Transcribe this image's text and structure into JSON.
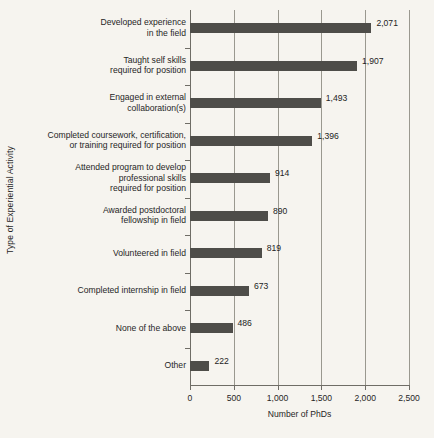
{
  "chart_data": {
    "type": "bar",
    "orientation": "horizontal",
    "title": "",
    "xlabel": "Number of PhDs",
    "ylabel": "Type of Experiential Activity",
    "xlim": [
      0,
      2500
    ],
    "xticks": [
      "0",
      "500",
      "1,000",
      "1,500",
      "2,000",
      "2,500"
    ],
    "xtick_values": [
      0,
      500,
      1000,
      1500,
      2000,
      2500
    ],
    "grid": "vertical",
    "legend": "none",
    "bar_color": "#4e4d49",
    "background_color": "#f6f4ef",
    "categories": [
      "Developed experience\nin the field",
      "Taught self skills\nrequired for position",
      "Engaged in external\ncollaboration(s)",
      "Completed coursework, certification,\nor training required for position",
      "Attended program to develop\nprofessional skills\nrequired for position",
      "Awarded postdoctoral\nfellowship in field",
      "Volunteered in field",
      "Completed internship in field",
      "None of the above",
      "Other"
    ],
    "values": [
      2071,
      1907,
      1493,
      1396,
      914,
      890,
      819,
      673,
      486,
      222
    ],
    "value_labels": [
      "2,071",
      "1,907",
      "1,493",
      "1,396",
      "914",
      "890",
      "819",
      "673",
      "486",
      "222"
    ]
  }
}
